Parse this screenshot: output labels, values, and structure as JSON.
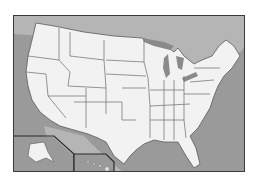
{
  "map": {
    "title": "United States map",
    "colors": {
      "land": "#f2f2f2",
      "water": "#9a9a9a",
      "neighbor_land": "#b8b8b8",
      "border": "#5a5a5a",
      "frame": "#3a3a3a"
    },
    "insets": [
      "Alaska",
      "Hawaii"
    ]
  }
}
